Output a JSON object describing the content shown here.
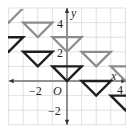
{
  "diagram": {
    "type": "coordinate-grid-translation",
    "grid": {
      "x_range": [
        -4,
        4
      ],
      "y_range": [
        -3,
        5
      ],
      "unit": 1,
      "grid_color": "#d9d9d9",
      "axis_color": "#333333"
    },
    "axes": {
      "x_label": "x",
      "y_label": "y",
      "origin_label": "O",
      "x_ticks": [
        {
          "value": -2,
          "label": "−2"
        },
        {
          "value": 4,
          "label": "4"
        }
      ],
      "y_ticks": [
        {
          "value": 4,
          "label": "4"
        },
        {
          "value": 2,
          "label": "2"
        },
        {
          "value": -2,
          "label": "−2"
        }
      ]
    },
    "colors": {
      "gray_triangle": "#8c8c8c",
      "black_triangle": "#1e1e1e"
    },
    "gray_triangles": [
      {
        "points": [
          [
            -5,
            5
          ],
          [
            -3,
            5
          ],
          [
            -4,
            4
          ]
        ],
        "clipped": true
      },
      {
        "points": [
          [
            -3,
            4
          ],
          [
            -1,
            4
          ],
          [
            -2,
            3
          ]
        ]
      },
      {
        "points": [
          [
            -1,
            3
          ],
          [
            1,
            3
          ],
          [
            0,
            2
          ]
        ]
      },
      {
        "points": [
          [
            1,
            2
          ],
          [
            3,
            2
          ],
          [
            2,
            1
          ]
        ]
      },
      {
        "points": [
          [
            3,
            1
          ],
          [
            5,
            1
          ],
          [
            4,
            0
          ]
        ],
        "clipped": true
      }
    ],
    "black_triangles": [
      {
        "points": [
          [
            -5,
            3
          ],
          [
            -3,
            3
          ],
          [
            -4,
            2
          ]
        ],
        "clipped": true
      },
      {
        "points": [
          [
            -3,
            2
          ],
          [
            -1,
            2
          ],
          [
            -2,
            1
          ]
        ]
      },
      {
        "points": [
          [
            -1,
            1
          ],
          [
            1,
            1
          ],
          [
            0,
            0
          ]
        ]
      },
      {
        "points": [
          [
            1,
            0
          ],
          [
            3,
            0
          ],
          [
            2,
            -1
          ]
        ]
      },
      {
        "points": [
          [
            3,
            -1
          ],
          [
            5,
            -1
          ],
          [
            4,
            -2
          ]
        ],
        "clipped": true
      }
    ]
  }
}
